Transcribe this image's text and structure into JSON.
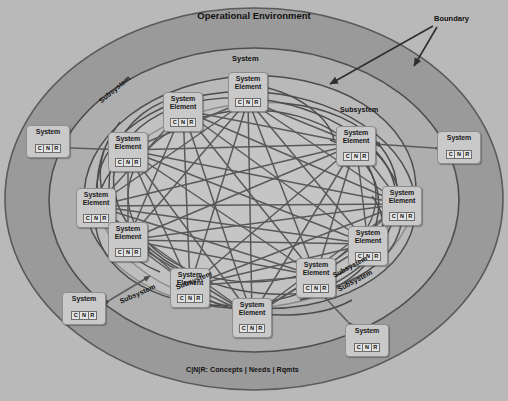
{
  "diagram": {
    "title": "Operational Environment",
    "legend": "C|N|R: Concepts | Needs | Rqmts",
    "boundary_label": "Boundary",
    "system_label": "System",
    "subsystem_label": "Subsystem",
    "element_label_line1": "System",
    "element_label_line2": "Element",
    "cnr": {
      "c": "C",
      "n": "N",
      "r": "R"
    },
    "colors": {
      "outer_background": "#b9b9b9",
      "operational_environment_band": "#9a9a9a",
      "system_band": "#ababab",
      "subsystem_fill": "#c0c0c0",
      "core_fill": "#c6c6c6",
      "node_fill": "#c9c9c9",
      "cnr_fill": "#e3e3e3",
      "stroke": "#4d4d4d",
      "text": "#1b1b1b"
    }
  },
  "labels": {
    "title": "Operational Environment",
    "boundary": "Boundary",
    "legend": "C|N|R: Concepts | Needs | Rqmts",
    "system_top": "System",
    "subsystem_left": "Subsystem",
    "subsystem_right": "Subsystem",
    "subsystem_bottom_left": "Subsystem",
    "subsystem_bottom_mid": "Subsystem",
    "subsystem_bottom_right_a": "Subsystem",
    "subsystem_bottom_right_b": "Subsystem"
  },
  "systems": [
    {
      "id": "system-left",
      "label": "System",
      "cnr": "C | N | R",
      "x": 26,
      "y": 125
    },
    {
      "id": "system-right",
      "label": "System",
      "cnr": "C | N | R",
      "x": 437,
      "y": 131
    },
    {
      "id": "system-bottom-left",
      "label": "System",
      "cnr": "C | N | R",
      "x": 62,
      "y": 292
    },
    {
      "id": "system-bottom-right",
      "label": "System",
      "cnr": "C | N | R",
      "x": 345,
      "y": 324
    }
  ],
  "system_elements": [
    {
      "id": "element-top",
      "line1": "System",
      "line2": "Element",
      "cnr": "C | N | R",
      "x": 228,
      "y": 72
    },
    {
      "id": "element-upper-left",
      "line1": "System",
      "line2": "Element",
      "cnr": "C | N | R",
      "x": 163,
      "y": 92
    },
    {
      "id": "element-upper-right",
      "line1": "System",
      "line2": "Element",
      "cnr": "C | N | R",
      "x": 336,
      "y": 126
    },
    {
      "id": "element-left",
      "line1": "System",
      "line2": "Element",
      "cnr": "C | N | R",
      "x": 108,
      "y": 132
    },
    {
      "id": "element-mid-left",
      "line1": "System",
      "line2": "Element",
      "cnr": "C | N | R",
      "x": 76,
      "y": 188
    },
    {
      "id": "element-mid-right",
      "line1": "System",
      "line2": "Element",
      "cnr": "C | N | R",
      "x": 382,
      "y": 186
    },
    {
      "id": "element-lower-left",
      "line1": "System",
      "line2": "Element",
      "cnr": "C | N | R",
      "x": 108,
      "y": 222
    },
    {
      "id": "element-lower-right",
      "line1": "System",
      "line2": "Element",
      "cnr": "C | N | R",
      "x": 348,
      "y": 226
    },
    {
      "id": "element-bottom-left",
      "line1": "System",
      "line2": "Element",
      "cnr": "C | N | R",
      "x": 170,
      "y": 268
    },
    {
      "id": "element-bottom-right",
      "line1": "System",
      "line2": "Element",
      "cnr": "C | N | R",
      "x": 296,
      "y": 258
    },
    {
      "id": "element-bottom-mid",
      "line1": "System",
      "line2": "Element",
      "cnr": "C | N | R",
      "x": 232,
      "y": 298
    }
  ]
}
